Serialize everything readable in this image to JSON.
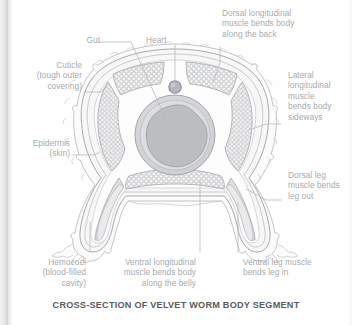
{
  "figure": {
    "caption": "CROSS-SECTION OF VELVET WORM BODY SEGMENT",
    "label_color": "#a9abae",
    "caption_color": "#5a5c60",
    "background_color": "#fefefe",
    "leader_line_color": "#b5b7ba"
  },
  "labels": [
    {
      "id": "gut",
      "text": "Gut",
      "align": "right"
    },
    {
      "id": "heart",
      "text": "Heart",
      "align": "left"
    },
    {
      "id": "dorsal-long",
      "text": "Dorsal longitudinal\nmuscle bends body\nalong the back",
      "align": "left"
    },
    {
      "id": "lateral-long",
      "text": "Lateral\nlongitudinal\nmuscle\nbends body\nsideways",
      "align": "left"
    },
    {
      "id": "cuticle",
      "text": "Cuticle\n(tough outer\ncovering)",
      "align": "right"
    },
    {
      "id": "epidermis",
      "text": "Epidermis\n(skin)",
      "align": "right"
    },
    {
      "id": "dorsal-leg",
      "text": "Dorsal leg\nmuscle bends\nleg out",
      "align": "left"
    },
    {
      "id": "hemocoel",
      "text": "Hemocoel\n(blood-filled\ncavity)",
      "align": "right"
    },
    {
      "id": "ventral-long",
      "text": "Ventral longitudinal\nmuscle bends body\nalong the belly",
      "align": "right"
    },
    {
      "id": "ventral-leg",
      "text": "Ventral leg muscle\nbends leg in",
      "align": "left"
    }
  ],
  "anatomy_parts": [
    "cuticle-outer-layer",
    "epidermis-layer",
    "dorsal-longitudinal-muscle",
    "lateral-longitudinal-muscle",
    "ventral-longitudinal-muscle",
    "dorsal-leg-muscle",
    "ventral-leg-muscle",
    "gut-ring",
    "gut-lumen",
    "heart-vessel",
    "hemocoel-cavity"
  ]
}
